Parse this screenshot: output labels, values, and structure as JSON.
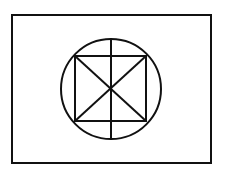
{
  "diagram": {
    "stroke_color": "#111111",
    "background_color": "#ffffff",
    "frame": {
      "x": 12,
      "y": 15,
      "width": 199,
      "height": 148
    },
    "circle": {
      "cx": 111,
      "cy": 89,
      "r": 50
    },
    "square": {
      "x1": 75,
      "y1": 56,
      "x2": 146,
      "y2": 121
    },
    "vertical_line": {
      "x": 111,
      "y1": 39,
      "y2": 139
    }
  }
}
